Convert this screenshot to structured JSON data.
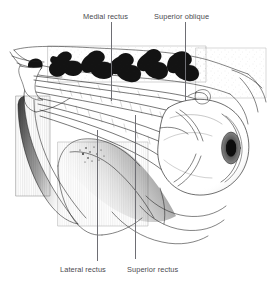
{
  "figure": {
    "background_color": "#ffffff",
    "ink_color": "#1a1a1a",
    "label_color": "#4a4a4f",
    "leader_color": "#6e6e74",
    "width": 271,
    "height": 284
  },
  "labels": [
    {
      "id": "medial-rectus",
      "text": "Medial rectus",
      "x": 83,
      "y": 12,
      "leader": {
        "x1": 111,
        "y1": 22,
        "x2": 111,
        "y2": 101
      }
    },
    {
      "id": "superior-oblique",
      "text": "Superior oblique",
      "x": 154,
      "y": 12,
      "leader": {
        "x1": 185,
        "y1": 22,
        "x2": 185,
        "y2": 101
      }
    },
    {
      "id": "lateral-rectus",
      "text": "Lateral rectus",
      "x": 60,
      "y": 265,
      "leader": {
        "x1": 97,
        "y1": 130,
        "x2": 97,
        "y2": 261
      }
    },
    {
      "id": "superior-rectus",
      "text": "Superior rectus",
      "x": 127,
      "y": 265,
      "leader": {
        "x1": 137,
        "y1": 115,
        "x2": 134,
        "y2": 259
      }
    }
  ],
  "anatomy": {
    "structures": [
      "orbital roof bone cross-section",
      "orbital apex",
      "medial rectus muscle",
      "superior oblique muscle and trochlea",
      "lateral rectus muscle",
      "superior rectus muscle",
      "globe (eyeball)",
      "iris and pupil",
      "cornea",
      "maxillary sinus wall"
    ],
    "view": "lateral",
    "technique": "pen-and-ink stipple line drawing"
  }
}
